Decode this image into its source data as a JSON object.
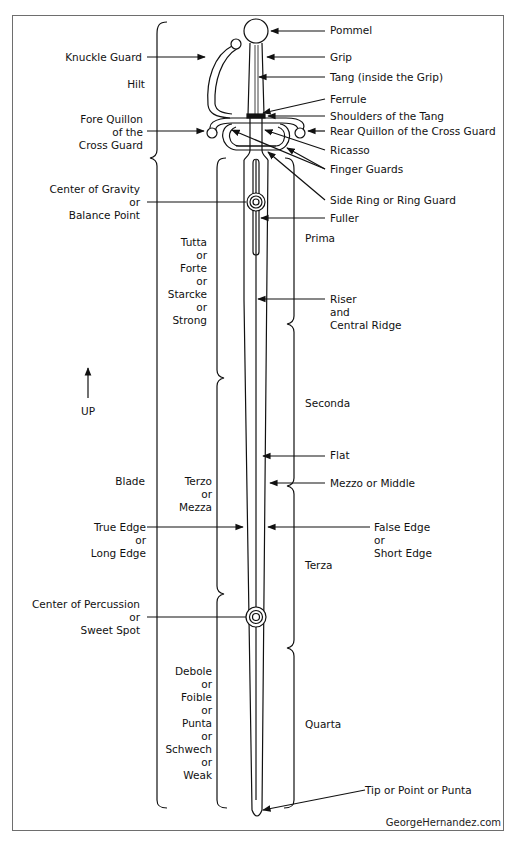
{
  "diagram": {
    "credit": "GeorgeHernandez.com",
    "up_label": "UP",
    "right_labels": {
      "pommel": "Pommel",
      "grip": "Grip",
      "tang": "Tang (inside the Grip)",
      "ferrule": "Ferrule",
      "shoulders": "Shoulders of the Tang",
      "rear_quillon": "Rear Quillon of the Cross Guard",
      "ricasso": "Ricasso",
      "finger_guards": "Finger Guards",
      "side_ring": "Side Ring or Ring Guard",
      "fuller": "Fuller",
      "riser": [
        "Riser",
        "and",
        "Central Ridge"
      ],
      "flat": "Flat",
      "mezzo": "Mezzo or Middle",
      "false_edge": [
        "False Edge",
        "or",
        "Short Edge"
      ],
      "tip": "Tip or Point or Punta"
    },
    "left_labels": {
      "knuckle_guard": "Knuckle Guard",
      "hilt": "Hilt",
      "fore_quillon": [
        "Fore Quillon",
        "of the",
        "Cross Guard"
      ],
      "center_gravity": [
        "Center of Gravity",
        "or",
        "Balance Point"
      ],
      "blade": "Blade",
      "true_edge": [
        "True Edge",
        "or",
        "Long Edge"
      ],
      "center_percussion": [
        "Center of Percussion",
        "or",
        "Sweet Spot"
      ]
    },
    "thirds": {
      "forte": [
        "Tutta",
        "or",
        "Forte",
        "or",
        "Starcke",
        "or",
        "Strong"
      ],
      "mezza": [
        "Terzo",
        "or",
        "Mezza"
      ],
      "debole": [
        "Debole",
        "or",
        "Foible",
        "or",
        "Punta",
        "or",
        "Schwech",
        "or",
        "Weak"
      ]
    },
    "quarters": {
      "prima": "Prima",
      "seconda": "Seconda",
      "terza": "Terza",
      "quarta": "Quarta"
    },
    "colors": {
      "line": "#111111",
      "frame": "#6e6e6e",
      "background": "#ffffff"
    }
  }
}
